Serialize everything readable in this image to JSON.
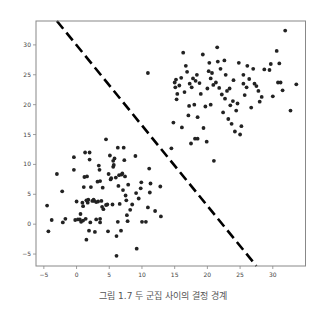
{
  "chart_data": {
    "type": "scatter",
    "title": "",
    "xlabel": "",
    "ylabel": "",
    "xlim": [
      -6.2,
      35
    ],
    "ylim": [
      -7,
      34
    ],
    "xticks": [
      -5,
      0,
      5,
      10,
      15,
      20,
      25,
      30
    ],
    "yticks": [
      -5,
      0,
      5,
      10,
      15,
      20,
      25,
      30
    ],
    "grid": false,
    "legend": null,
    "point_color": "#222222",
    "series": [
      {
        "name": "cluster-1",
        "points": [
          [
            -4.5,
            3.1
          ],
          [
            -4.3,
            -1.2
          ],
          [
            -3.8,
            0.7
          ],
          [
            -3.0,
            8.4
          ],
          [
            -2.2,
            5.5
          ],
          [
            -2.1,
            0.3
          ],
          [
            -1.7,
            0.9
          ],
          [
            -0.4,
            11.2
          ],
          [
            -0.4,
            9.1
          ],
          [
            -0.2,
            0.7
          ],
          [
            0.0,
            3.8
          ],
          [
            0.5,
            0.8
          ],
          [
            0.6,
            1.7
          ],
          [
            0.7,
            0.4
          ],
          [
            0.9,
            3.6
          ],
          [
            1.0,
            3.0
          ],
          [
            1.0,
            0.6
          ],
          [
            1.1,
            6.2
          ],
          [
            1.2,
            7.9
          ],
          [
            1.3,
            12.0
          ],
          [
            1.4,
            0.9
          ],
          [
            1.5,
            -2.6
          ],
          [
            1.6,
            8.0
          ],
          [
            1.7,
            3.6
          ],
          [
            1.8,
            4.1
          ],
          [
            1.9,
            -1.1
          ],
          [
            2.0,
            10.8
          ],
          [
            2.1,
            0.3
          ],
          [
            2.2,
            6.2
          ],
          [
            2.4,
            3.9
          ],
          [
            2.7,
            3.9
          ],
          [
            2.8,
            -1.3
          ],
          [
            3.0,
            3.7
          ],
          [
            3.0,
            0.8
          ],
          [
            3.2,
            7.1
          ],
          [
            3.3,
            3.8
          ],
          [
            3.4,
            9.8
          ],
          [
            3.5,
            9.1
          ],
          [
            3.6,
            0.9
          ],
          [
            3.6,
            0.3
          ],
          [
            3.8,
            3.9
          ],
          [
            3.9,
            2.9
          ],
          [
            4.0,
            6.1
          ],
          [
            4.1,
            2.5
          ],
          [
            4.5,
            3.2
          ],
          [
            4.8,
            -1.2
          ],
          [
            4.9,
            8.4
          ],
          [
            5.1,
            11.5
          ],
          [
            5.2,
            7.5
          ],
          [
            5.3,
            7.7
          ],
          [
            5.5,
            3.3
          ],
          [
            5.6,
            9.6
          ],
          [
            5.7,
            9.9
          ],
          [
            5.8,
            11.0
          ],
          [
            6.0,
            7.8
          ],
          [
            6.1,
            -2.0
          ],
          [
            6.3,
            0.4
          ],
          [
            6.4,
            6.4
          ],
          [
            6.5,
            8.2
          ],
          [
            6.6,
            3.4
          ],
          [
            6.8,
            -1.1
          ],
          [
            6.9,
            8.3
          ],
          [
            7.0,
            8.5
          ],
          [
            7.1,
            5.7
          ],
          [
            7.2,
            12.8
          ],
          [
            7.3,
            10.7
          ],
          [
            7.4,
            8.0
          ],
          [
            7.5,
            4.8
          ],
          [
            7.6,
            4.0
          ],
          [
            7.7,
            1.5
          ],
          [
            7.8,
            0.5
          ],
          [
            7.9,
            6.6
          ],
          [
            8.2,
            2.4
          ],
          [
            8.5,
            3.3
          ],
          [
            9.0,
            11.4
          ],
          [
            9.1,
            5.2
          ],
          [
            9.2,
            -4.1
          ],
          [
            9.5,
            4.3
          ],
          [
            9.8,
            6.0
          ],
          [
            9.9,
            7.0
          ],
          [
            10.0,
            0.4
          ],
          [
            10.6,
            0.4
          ],
          [
            10.9,
            2.8
          ],
          [
            11.1,
            9.3
          ],
          [
            11.2,
            5.3
          ],
          [
            11.3,
            6.8
          ],
          [
            12.0,
            2.2
          ],
          [
            12.8,
            6.3
          ],
          [
            12.9,
            1.3
          ],
          [
            6.1,
            -5.3
          ],
          [
            2.0,
            12.0
          ],
          [
            4.5,
            14.2
          ],
          [
            6.3,
            12.8
          ],
          [
            5.6,
            10.6
          ],
          [
            3.6,
            7.2
          ],
          [
            4.7,
            3.3
          ],
          [
            0.2,
            0.8
          ],
          [
            1.5,
            4.0
          ],
          [
            2.6,
            4.1
          ]
        ]
      },
      {
        "name": "cluster-2",
        "points": [
          [
            10.9,
            25.3
          ],
          [
            14.5,
            12.7
          ],
          [
            14.8,
            17.0
          ],
          [
            15.0,
            23.7
          ],
          [
            15.1,
            22.9
          ],
          [
            15.2,
            24.2
          ],
          [
            15.3,
            20.9
          ],
          [
            15.4,
            21.8
          ],
          [
            15.7,
            23.2
          ],
          [
            16.0,
            24.5
          ],
          [
            16.1,
            16.2
          ],
          [
            16.3,
            28.7
          ],
          [
            16.5,
            22.1
          ],
          [
            16.7,
            26.5
          ],
          [
            16.9,
            25.5
          ],
          [
            17.1,
            18.2
          ],
          [
            17.3,
            23.5
          ],
          [
            17.5,
            13.5
          ],
          [
            17.6,
            22.9
          ],
          [
            17.8,
            24.4
          ],
          [
            18.0,
            20.0
          ],
          [
            18.1,
            14.3
          ],
          [
            18.2,
            24.0
          ],
          [
            18.4,
            25.0
          ],
          [
            18.5,
            17.9
          ],
          [
            18.8,
            23.6
          ],
          [
            19.0,
            21.8
          ],
          [
            19.3,
            28.4
          ],
          [
            19.4,
            16.1
          ],
          [
            19.7,
            19.7
          ],
          [
            20.0,
            22.7
          ],
          [
            20.2,
            25.6
          ],
          [
            20.3,
            27.0
          ],
          [
            20.5,
            24.4
          ],
          [
            20.7,
            25.3
          ],
          [
            20.9,
            23.3
          ],
          [
            21.0,
            10.6
          ],
          [
            21.3,
            23.7
          ],
          [
            21.5,
            29.6
          ],
          [
            21.6,
            27.2
          ],
          [
            21.8,
            22.8
          ],
          [
            22.0,
            26.0
          ],
          [
            22.2,
            21.7
          ],
          [
            22.4,
            18.7
          ],
          [
            22.6,
            27.4
          ],
          [
            22.8,
            25.0
          ],
          [
            23.0,
            22.3
          ],
          [
            23.2,
            17.6
          ],
          [
            23.5,
            19.9
          ],
          [
            23.7,
            16.8
          ],
          [
            23.9,
            20.6
          ],
          [
            24.0,
            24.1
          ],
          [
            24.2,
            15.5
          ],
          [
            24.4,
            19.0
          ],
          [
            24.6,
            20.2
          ],
          [
            24.8,
            27.0
          ],
          [
            25.0,
            15.0
          ],
          [
            25.2,
            16.4
          ],
          [
            25.5,
            23.5
          ],
          [
            25.7,
            21.6
          ],
          [
            26.0,
            22.9
          ],
          [
            26.1,
            26.5
          ],
          [
            26.4,
            24.3
          ],
          [
            26.7,
            19.5
          ],
          [
            27.0,
            26.0
          ],
          [
            27.2,
            23.5
          ],
          [
            27.5,
            23.1
          ],
          [
            28.0,
            20.5
          ],
          [
            28.3,
            21.3
          ],
          [
            28.7,
            25.9
          ],
          [
            29.5,
            25.8
          ],
          [
            30.0,
            21.4
          ],
          [
            30.6,
            29.0
          ],
          [
            30.8,
            23.7
          ],
          [
            31.0,
            26.9
          ],
          [
            31.2,
            23.7
          ],
          [
            31.5,
            22.4
          ],
          [
            31.9,
            32.4
          ],
          [
            29.7,
            26.8
          ],
          [
            32.7,
            19.0
          ],
          [
            33.6,
            23.4
          ],
          [
            17.2,
            19.8
          ],
          [
            20.5,
            20.0
          ],
          [
            22.7,
            21.0
          ],
          [
            19.9,
            13.8
          ],
          [
            18.5,
            14.3
          ],
          [
            23.4,
            22.7
          ],
          [
            25.5,
            25.0
          ],
          [
            27.8,
            22.3
          ]
        ]
      }
    ],
    "decision_boundary": {
      "style": "dashed",
      "color": "#000000",
      "from": [
        -3.0,
        34.0
      ],
      "to": [
        27.5,
        -7.0
      ]
    },
    "caption": "그림 1.7 두 군집 사이의 결정 경계"
  }
}
